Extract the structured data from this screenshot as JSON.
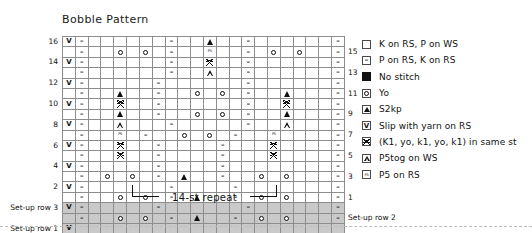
{
  "chart": {
    "title": "Bobble Pattern",
    "repeat_label": "14-st repeat",
    "columns": 22,
    "repeat_start_col": 5,
    "repeat_end_col": 18,
    "row_labels_left": [
      "16",
      "14",
      "12",
      "10",
      "8",
      "6",
      "4",
      "2",
      "Set-up row 3",
      "Set-up row 1"
    ],
    "row_labels_right": [
      "15",
      "13",
      "11",
      "9",
      "7",
      "5",
      "3",
      "1",
      "Set-up row 2"
    ],
    "setup_rows": [
      "Set-up row 1",
      "Set-up row 2",
      "Set-up row 3"
    ]
  },
  "legend": {
    "items": [
      {
        "symbol": "empty-square",
        "label": "K on RS, P on WS"
      },
      {
        "symbol": "dash",
        "label": "P on RS, K on RS"
      },
      {
        "symbol": "filled-square",
        "label": "No stitch"
      },
      {
        "symbol": "circle",
        "label": "Yo"
      },
      {
        "symbol": "triangle-solid",
        "label": "S2kp"
      },
      {
        "symbol": "v",
        "label": "Slip with yarn on RS"
      },
      {
        "symbol": "double-v",
        "label": "(K1, yo, k1, yo, k1) in same st"
      },
      {
        "symbol": "triangle-outline",
        "label": "P5tog on WS"
      },
      {
        "symbol": "p5-text",
        "label": "P5 on RS"
      }
    ]
  },
  "chart_data": {
    "type": "table",
    "title": "Bobble Pattern",
    "xlabel": "stitches",
    "ylabel": "rows",
    "legend_keys": {
      "k": "K on RS, P on WS",
      "p": "P on RS, K on RS",
      "ns": "No stitch",
      "yo": "Yo",
      "a": "S2kp",
      "v": "Slip with yarn on RS",
      "b": "(K1, yo, k1, yo, k1) in same st",
      "at": "P5tog on WS",
      "p5": "P5 on RS"
    },
    "rows": [
      {
        "name": "16",
        "side": "WS",
        "cells": [
          "v",
          "p",
          "ns",
          "ns",
          "k",
          "k",
          "k",
          "k",
          "p",
          "k",
          "k",
          "a",
          "k",
          "k",
          "p",
          "k",
          "k",
          "k",
          "k",
          "ns",
          "ns",
          "p"
        ]
      },
      {
        "name": "15",
        "side": "RS",
        "cells": [
          "k",
          "p",
          "ns",
          "ns",
          "yo",
          "k",
          "yo",
          "k",
          "p",
          "k",
          "k",
          "p5",
          "k",
          "k",
          "p",
          "k",
          "yo",
          "k",
          "yo",
          "ns",
          "ns",
          "p"
        ]
      },
      {
        "name": "14",
        "side": "WS",
        "cells": [
          "v",
          "p",
          "ns",
          "ns",
          "k",
          "k",
          "k",
          "ns",
          "p",
          "k",
          "k",
          "b",
          "k",
          "k",
          "p",
          "ns",
          "k",
          "k",
          "k",
          "ns",
          "ns",
          "p"
        ]
      },
      {
        "name": "13",
        "side": "RS",
        "cells": [
          "k",
          "p",
          "ns",
          "ns",
          "k",
          "k",
          "k",
          "ns",
          "p",
          "k",
          "k",
          "at",
          "k",
          "k",
          "p",
          "ns",
          "k",
          "k",
          "k",
          "ns",
          "ns",
          "p"
        ]
      },
      {
        "name": "12",
        "side": "WS",
        "cells": [
          "v",
          "p",
          "ns",
          "ns",
          "k",
          "k",
          "k",
          "p",
          "k",
          "k",
          "k",
          "k",
          "k",
          "k",
          "p",
          "k",
          "k",
          "k",
          "k",
          "ns",
          "ns",
          "p"
        ]
      },
      {
        "name": "11",
        "side": "RS",
        "cells": [
          "k",
          "p",
          "ns",
          "k",
          "a",
          "k",
          "k",
          "p",
          "k",
          "k",
          "yo",
          "k",
          "yo",
          "k",
          "p",
          "k",
          "k",
          "a",
          "k",
          "ns",
          "ns",
          "p"
        ]
      },
      {
        "name": "10",
        "side": "WS",
        "cells": [
          "v",
          "p",
          "ns",
          "k",
          "b",
          "k",
          "k",
          "p",
          "k",
          "k",
          "k",
          "k",
          "k",
          "k",
          "p",
          "k",
          "k",
          "b",
          "k",
          "ns",
          "ns",
          "p"
        ]
      },
      {
        "name": "9",
        "side": "RS",
        "cells": [
          "k",
          "p",
          "ns",
          "k",
          "a",
          "k",
          "k",
          "p",
          "k",
          "k",
          "yo",
          "k",
          "yo",
          "k",
          "p",
          "k",
          "k",
          "a",
          "k",
          "ns",
          "ns",
          "p"
        ]
      },
      {
        "name": "8",
        "side": "WS",
        "cells": [
          "v",
          "p",
          "ns",
          "k",
          "at",
          "k",
          "k",
          "k",
          "p",
          "k",
          "k",
          "k",
          "k",
          "k",
          "p",
          "k",
          "k",
          "at",
          "k",
          "ns",
          "ns",
          "p"
        ]
      },
      {
        "name": "7",
        "side": "RS",
        "cells": [
          "k",
          "p",
          "ns",
          "k",
          "p5",
          "k",
          "p",
          "k",
          "k",
          "yo",
          "k",
          "yo",
          "k",
          "p",
          "k",
          "k",
          "p5",
          "k",
          "k",
          "ns",
          "ns",
          "p"
        ]
      },
      {
        "name": "6",
        "side": "WS",
        "cells": [
          "v",
          "p",
          "ns",
          "k",
          "b",
          "k",
          "ns",
          "p",
          "k",
          "k",
          "k",
          "k",
          "p",
          "ns",
          "k",
          "k",
          "b",
          "k",
          "k",
          "ns",
          "ns",
          "p"
        ]
      },
      {
        "name": "5",
        "side": "RS",
        "cells": [
          "k",
          "p",
          "ns",
          "k",
          "b",
          "k",
          "ns",
          "p",
          "k",
          "k",
          "k",
          "k",
          "p",
          "ns",
          "k",
          "k",
          "b",
          "k",
          "k",
          "ns",
          "ns",
          "p"
        ]
      },
      {
        "name": "4",
        "side": "WS",
        "cells": [
          "v",
          "p",
          "k",
          "k",
          "k",
          "k",
          "k",
          "p",
          "k",
          "k",
          "k",
          "k",
          "p",
          "k",
          "ns",
          "k",
          "k",
          "k",
          "k",
          "ns",
          "ns",
          "p"
        ]
      },
      {
        "name": "3",
        "side": "RS",
        "cells": [
          "k",
          "p",
          "k",
          "yo",
          "k",
          "yo",
          "k",
          "p",
          "k",
          "a",
          "k",
          "k",
          "p",
          "k",
          "k",
          "yo",
          "k",
          "yo",
          "k",
          "ns",
          "ns",
          "p"
        ]
      },
      {
        "name": "2",
        "side": "WS",
        "cells": [
          "v",
          "p",
          "ns",
          "k",
          "k",
          "k",
          "k",
          "k",
          "p",
          "k",
          "k",
          "k",
          "k",
          "p",
          "k",
          "k",
          "k",
          "k",
          "k",
          "ns",
          "ns",
          "p"
        ]
      },
      {
        "name": "1",
        "side": "RS",
        "cells": [
          "k",
          "p",
          "ns",
          "k",
          "yo",
          "k",
          "yo",
          "k",
          "p",
          "k",
          "a",
          "k",
          "k",
          "p",
          "k",
          "yo",
          "k",
          "yo",
          "k",
          "ns",
          "ns",
          "p"
        ]
      },
      {
        "name": "Set-up row 3",
        "side": "WS",
        "cells": [
          "v",
          "p",
          "ns",
          "ns",
          "k",
          "k",
          "k",
          "p",
          "k",
          "k",
          "k",
          "k",
          "k",
          "k",
          "p",
          "k",
          "k",
          "k",
          "k",
          "ns",
          "ns",
          "p"
        ]
      },
      {
        "name": "Set-up row 2",
        "side": "RS",
        "cells": [
          "k",
          "p",
          "ns",
          "ns",
          "yo",
          "k",
          "yo",
          "k",
          "p",
          "k",
          "a",
          "k",
          "k",
          "p",
          "k",
          "yo",
          "k",
          "yo",
          "k",
          "ns",
          "ns",
          "p"
        ]
      },
      {
        "name": "Set-up row 1",
        "side": "WS",
        "cells": [
          "v",
          "k",
          "ns",
          "ns",
          "k",
          "k",
          "k",
          "k",
          "k",
          "k",
          "k",
          "k",
          "k",
          "k",
          "k",
          "k",
          "k",
          "k",
          "k",
          "ns",
          "ns",
          "k"
        ]
      }
    ]
  }
}
